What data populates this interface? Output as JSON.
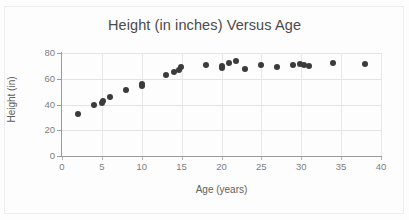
{
  "chart_data": {
    "type": "scatter",
    "title": "Height (in inches) Versus Age",
    "xlabel": "Age (years)",
    "ylabel": "Height (in)",
    "xlim": [
      0,
      40
    ],
    "ylim": [
      0,
      80
    ],
    "xticks": [
      0,
      5,
      10,
      15,
      20,
      25,
      30,
      35,
      40
    ],
    "yticks": [
      0,
      20,
      40,
      60,
      80
    ],
    "grid": true,
    "legend": false,
    "marker_color": "#3b3b3b",
    "series": [
      {
        "name": "Height vs Age",
        "points": [
          [
            2,
            33
          ],
          [
            4,
            40
          ],
          [
            5,
            41.5
          ],
          [
            5.2,
            42.5
          ],
          [
            6,
            46
          ],
          [
            8,
            51.5
          ],
          [
            10,
            54
          ],
          [
            10,
            56
          ],
          [
            13,
            63
          ],
          [
            14,
            65
          ],
          [
            14.7,
            67
          ],
          [
            14.9,
            69
          ],
          [
            18,
            70.5
          ],
          [
            20,
            68
          ],
          [
            20,
            70
          ],
          [
            21,
            72
          ],
          [
            21.8,
            74
          ],
          [
            23,
            67.5
          ],
          [
            25,
            71
          ],
          [
            27,
            69.5
          ],
          [
            29,
            70.5
          ],
          [
            29.8,
            71.5
          ],
          [
            30.3,
            70.5
          ],
          [
            31,
            70
          ],
          [
            34,
            72.5
          ],
          [
            38,
            71.5
          ]
        ]
      }
    ]
  },
  "axis": {
    "x_tick_labels": [
      "0",
      "5",
      "10",
      "15",
      "20",
      "25",
      "30",
      "35",
      "40"
    ],
    "y_tick_labels": [
      "0",
      "20",
      "40",
      "60",
      "80"
    ]
  }
}
